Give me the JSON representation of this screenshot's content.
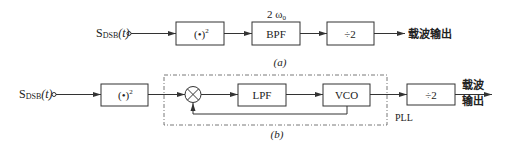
{
  "diagram_a": {
    "input_label": "S",
    "input_sub": "DSB",
    "input_arg": "(t)",
    "square_block": "(•)",
    "square_exp": "2",
    "bpf_block": "BPF",
    "bpf_note": "2 ω",
    "bpf_note_sub": "0",
    "divider_block": "÷2",
    "output_label": "载波输出",
    "caption": "(a)"
  },
  "diagram_b": {
    "input_label": "S",
    "input_sub": "DSB",
    "input_arg": "(t)",
    "square_block": "(•)",
    "square_exp": "2",
    "mixer": "multiplier",
    "lpf_block": "LPF",
    "vco_block": "VCO",
    "pll_label": "PLL",
    "divider_block": "÷2",
    "output_line1": "载波",
    "output_line2": "输出",
    "caption": "(b)"
  },
  "colors": {
    "stroke": "#333333",
    "background": "#ffffff"
  }
}
